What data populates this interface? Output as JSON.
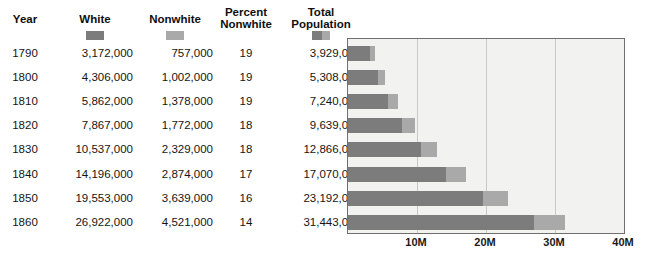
{
  "table": {
    "columns": [
      {
        "key": "year",
        "label": "Year"
      },
      {
        "key": "white",
        "label": "White"
      },
      {
        "key": "nonwhite",
        "label": "Nonwhite"
      },
      {
        "key": "percent_nonwhite",
        "label": "Percent\nNonwhite"
      },
      {
        "key": "total",
        "label": "Total\nPopulation"
      }
    ],
    "header_labels": {
      "year": "Year",
      "white": "White",
      "nonwhite": "Nonwhite",
      "percent_nonwhite_line1": "Percent",
      "percent_nonwhite_line2": "Nonwhite",
      "total_line1": "Total",
      "total_line2": "Population"
    },
    "rows": [
      {
        "year": "1790",
        "white": "3,172,000",
        "nonwhite": "757,000",
        "percent": "19",
        "total": "3,929,000"
      },
      {
        "year": "1800",
        "white": "4,306,000",
        "nonwhite": "1,002,000",
        "percent": "19",
        "total": "5,308,000"
      },
      {
        "year": "1810",
        "white": "5,862,000",
        "nonwhite": "1,378,000",
        "percent": "19",
        "total": "7,240,000"
      },
      {
        "year": "1820",
        "white": "7,867,000",
        "nonwhite": "1,772,000",
        "percent": "18",
        "total": "9,639,000"
      },
      {
        "year": "1830",
        "white": "10,537,000",
        "nonwhite": "2,329,000",
        "percent": "18",
        "total": "12,866,000"
      },
      {
        "year": "1840",
        "white": "14,196,000",
        "nonwhite": "2,874,000",
        "percent": "17",
        "total": "17,070,000"
      },
      {
        "year": "1850",
        "white": "19,553,000",
        "nonwhite": "3,639,000",
        "percent": "16",
        "total": "23,192,000"
      },
      {
        "year": "1860",
        "white": "26,922,000",
        "nonwhite": "4,521,000",
        "percent": "14",
        "total": "31,443,000"
      }
    ]
  },
  "legend": [
    {
      "name": "white-swatch",
      "label": "White",
      "color": "#7c7c7c"
    },
    {
      "name": "nonwhite-swatch",
      "label": "Nonwhite",
      "color": "#a9a9a9"
    },
    {
      "name": "total-population-swatch",
      "label": "Total Population",
      "color": "#7c7c7c"
    }
  ],
  "colors": {
    "white_series": "#7c7c7c",
    "nonwhite_series": "#a9a9a9",
    "plot_background": "#f2f2f0",
    "plot_border": "#6f6f6f",
    "gridline": "#c9c9c7"
  },
  "chart_data": {
    "type": "bar",
    "orientation": "horizontal",
    "stacked": true,
    "title": "",
    "xlabel": "",
    "ylabel": "",
    "categories": [
      "1790",
      "1800",
      "1810",
      "1820",
      "1830",
      "1840",
      "1850",
      "1860"
    ],
    "series": [
      {
        "name": "White",
        "color": "#7c7c7c",
        "values": [
          3172000,
          4306000,
          5862000,
          7867000,
          10537000,
          14196000,
          19553000,
          26922000
        ]
      },
      {
        "name": "Nonwhite",
        "color": "#a9a9a9",
        "values": [
          757000,
          1002000,
          1378000,
          1772000,
          2329000,
          2874000,
          3639000,
          4521000
        ]
      }
    ],
    "totals": [
      3929000,
      5308000,
      7240000,
      9639000,
      12866000,
      17070000,
      23192000,
      31443000
    ],
    "percent_nonwhite": [
      19,
      19,
      19,
      18,
      18,
      17,
      16,
      14
    ],
    "xlim": [
      0,
      40000000
    ],
    "xticks": [
      10000000,
      20000000,
      30000000,
      40000000
    ],
    "xtick_labels": [
      "10M",
      "20M",
      "30M",
      "40M"
    ],
    "grid": true,
    "legend_position": "table-header"
  }
}
